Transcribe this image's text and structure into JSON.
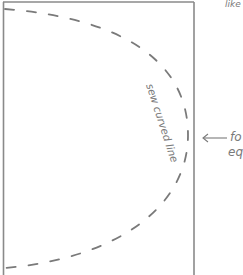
{
  "diagram": {
    "top_right_fragment": "like",
    "curve_label": "sew curved line",
    "fold_label_line1": "fo",
    "fold_label_line2": "eq",
    "colors": {
      "outline": "#8a8a8a",
      "dash": "#7a7a7a",
      "text": "#7a7a7a"
    }
  }
}
